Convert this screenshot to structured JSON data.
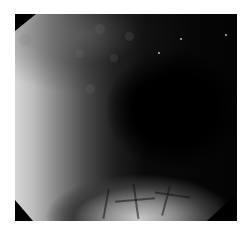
{
  "image": {
    "kind": "endoscopic-view",
    "tone": "grayscale",
    "background_color": "#ffffff",
    "frame_color": "#000000",
    "regions": {
      "left_wall": "bright mucosa",
      "center_right": "dark lumen",
      "bottom": "bright mucosa with vascular pattern"
    }
  }
}
